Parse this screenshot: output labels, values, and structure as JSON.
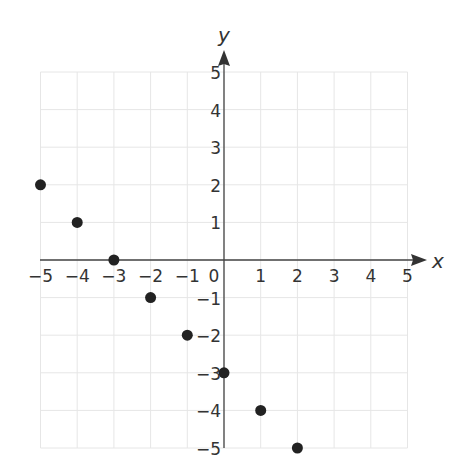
{
  "chart_data": {
    "type": "scatter",
    "title": "",
    "xlabel": "x",
    "ylabel": "y",
    "xlim": [
      -5,
      5
    ],
    "ylim": [
      -5,
      5
    ],
    "grid": true,
    "x_ticks": [
      -5,
      -4,
      -3,
      -2,
      -1,
      0,
      1,
      2,
      3,
      4,
      5
    ],
    "y_ticks": [
      -5,
      -4,
      -3,
      -2,
      -1,
      1,
      2,
      3,
      4,
      5
    ],
    "x_tick_labels": [
      "−5",
      "−4",
      "−3",
      "−2",
      "−1",
      "0",
      "1",
      "2",
      "3",
      "4",
      "5"
    ],
    "y_tick_labels": [
      "−5",
      "−4",
      "−3",
      "−2",
      "−1",
      "1",
      "2",
      "3",
      "4",
      "5"
    ],
    "points": [
      {
        "x": -5,
        "y": 2
      },
      {
        "x": -4,
        "y": 1
      },
      {
        "x": -3,
        "y": 0
      },
      {
        "x": -2,
        "y": -1
      },
      {
        "x": -1,
        "y": -2
      },
      {
        "x": 0,
        "y": -3
      },
      {
        "x": 1,
        "y": -4
      },
      {
        "x": 2,
        "y": -5
      }
    ],
    "colors": {
      "point": "#222222",
      "axis": "#444444",
      "grid": "#e6e6e6",
      "text": "#333333"
    }
  }
}
